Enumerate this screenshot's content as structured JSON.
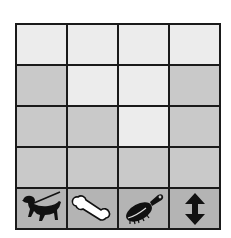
{
  "board": {
    "rows": 5,
    "cols": 4,
    "colors": {
      "light": "#ececec",
      "mid": "#c9c9c9",
      "dark": "#b4b4b4",
      "grid": "#1a1a1a"
    },
    "shading": [
      [
        "light",
        "light",
        "light",
        "light"
      ],
      [
        "mid",
        "light",
        "light",
        "mid"
      ],
      [
        "mid",
        "mid",
        "light",
        "mid"
      ],
      [
        "mid",
        "mid",
        "mid",
        "mid"
      ],
      [
        "dark",
        "dark",
        "dark",
        "dark"
      ]
    ],
    "icon_row": [
      {
        "icon": "dog-on-leash-icon",
        "label": "Dog"
      },
      {
        "icon": "bone-icon",
        "label": "Bone"
      },
      {
        "icon": "brush-icon",
        "label": "Brush"
      },
      {
        "icon": "up-down-arrow-icon",
        "label": "Move"
      }
    ]
  }
}
